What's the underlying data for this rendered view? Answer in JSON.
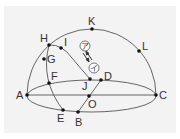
{
  "diagram": {
    "colors": {
      "line": "#555555",
      "point": "#111111",
      "label": "#333333",
      "background": "#f3f3f3"
    },
    "points": [
      {
        "id": "A",
        "x": 27,
        "y": 95,
        "lx": 16,
        "ly": 99
      },
      {
        "id": "B",
        "x": 78,
        "y": 112,
        "lx": 75,
        "ly": 126
      },
      {
        "id": "C",
        "x": 156,
        "y": 95,
        "lx": 159,
        "ly": 99
      },
      {
        "id": "D",
        "x": 101,
        "y": 80,
        "lx": 104,
        "ly": 80
      },
      {
        "id": "E",
        "x": 63,
        "y": 110,
        "lx": 57,
        "ly": 122
      },
      {
        "id": "F",
        "x": 49,
        "y": 83,
        "lx": 51,
        "ly": 80
      },
      {
        "id": "G",
        "x": 44,
        "y": 59,
        "lx": 47,
        "ly": 63
      },
      {
        "id": "H",
        "x": 49,
        "y": 45,
        "lx": 40,
        "ly": 42
      },
      {
        "id": "I",
        "x": 61,
        "y": 48,
        "lx": 64,
        "ly": 46
      },
      {
        "id": "J",
        "x": 90,
        "y": 79,
        "lx": 82,
        "ly": 90
      },
      {
        "id": "K",
        "x": 92,
        "y": 29,
        "lx": 88,
        "ly": 25
      },
      {
        "id": "L",
        "x": 139,
        "y": 51,
        "lx": 142,
        "ly": 50
      },
      {
        "id": "O",
        "x": 89,
        "y": 96,
        "lx": 88,
        "ly": 108
      }
    ],
    "markers": [
      {
        "id": "a",
        "glyph": "ア",
        "x": 85,
        "y": 46
      },
      {
        "id": "i",
        "glyph": "イ",
        "x": 94,
        "y": 68
      }
    ],
    "labels": {
      "A": "A",
      "B": "B",
      "C": "C",
      "D": "D",
      "E": "E",
      "F": "F",
      "G": "G",
      "H": "H",
      "I": "I",
      "J": "J",
      "K": "K",
      "L": "L",
      "O": "O",
      "marker_a": "ア",
      "marker_i": "イ"
    }
  }
}
